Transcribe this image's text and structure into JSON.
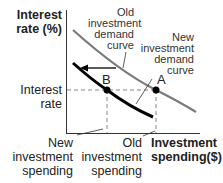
{
  "diagram": {
    "y_axis_label_line1": "Interest",
    "y_axis_label_line2": "rate (%)",
    "x_axis_label_line1": "Investment",
    "x_axis_label_line2": "spending($)",
    "y_tick_label_line1": "Interest",
    "y_tick_label_line2": "rate",
    "new_spending_line1": "New",
    "new_spending_line2": "investment",
    "new_spending_line3": "spending",
    "old_spending_line1": "Old",
    "old_spending_line2": "investment",
    "old_spending_line3": "spending",
    "old_curve_line1": "Old",
    "old_curve_line2": "investment",
    "old_curve_line3": "demand",
    "old_curve_line4": "curve",
    "new_curve_line1": "New",
    "new_curve_line2": "investment",
    "new_curve_line3": "demand",
    "new_curve_line4": "curve",
    "point_a": "A",
    "point_b": "B",
    "colors": {
      "old_curve": "#7a7a7a",
      "new_curve": "#000000",
      "axis": "#333333",
      "dashed": "#888888"
    }
  }
}
